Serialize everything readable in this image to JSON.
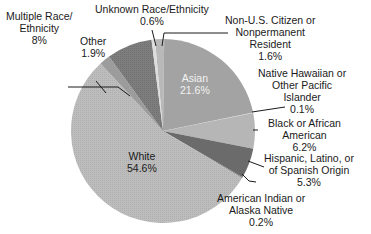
{
  "chart_data": {
    "type": "pie",
    "title": "",
    "center": [
      163,
      131
    ],
    "radius": 92,
    "start_angle_deg": -95,
    "slices": [
      {
        "name": "Non-U.S. Citizen or Nonpermanent Resident",
        "value": 1.6,
        "label": "1.6%",
        "color": "#b9b9b9"
      },
      {
        "name": "Asian",
        "value": 21.6,
        "label": "21.6%",
        "color": "#a3a3a3"
      },
      {
        "name": "Native Hawaiian or Other Pacific Islander",
        "value": 0.1,
        "label": "0.1%",
        "color": "#c8c8c8"
      },
      {
        "name": "Black or African American",
        "value": 6.2,
        "label": "6.2%",
        "color": "#b6b6b6"
      },
      {
        "name": "Hispanic, Latino, or of Spanish Origin",
        "value": 5.3,
        "label": "5.3%",
        "color": "#6b6b6b"
      },
      {
        "name": "American Indian or Alaska Native",
        "value": 0.2,
        "label": "0.2%",
        "color": "#8a8a8a"
      },
      {
        "name": "White",
        "value": 54.6,
        "label": "54.6%",
        "color": "#bdbdbd"
      },
      {
        "name": "Other",
        "value": 1.9,
        "label": "1.9%",
        "color": "#9c9c9c"
      },
      {
        "name": "Multiple Race/Ethnicity",
        "value": 8,
        "label": "8%",
        "color": "#7e7e7e"
      },
      {
        "name": "Unknown Race/Ethnicity",
        "value": 0.6,
        "label": "0.6%",
        "color": "#dcdcdc"
      }
    ],
    "legend": "none (callout labels)"
  },
  "labels": {
    "multiple": {
      "l1": "Multiple Race/",
      "l2": "Ethnicity",
      "l3": "8%"
    },
    "unknown": {
      "l1": "Unknown Race/Ethnicity",
      "l2": "0.6%"
    },
    "nonus": {
      "l1": "Non-U.S. Citizen or",
      "l2": "Nonpermanent",
      "l3": "Resident",
      "l4": "1.6%"
    },
    "other": {
      "l1": "Other",
      "l2": "1.9%"
    },
    "asian": {
      "l1": "Asian",
      "l2": "21.6%"
    },
    "hawaiian": {
      "l1": "Native Hawaiian or",
      "l2": "Other Pacific",
      "l3": "Islander",
      "l4": "0.1%"
    },
    "black": {
      "l1": "Black or African",
      "l2": "American",
      "l3": "6.2%"
    },
    "hispanic": {
      "l1": "Hispanic, Latino, or",
      "l2": "of Spanish Origin",
      "l3": "5.3%"
    },
    "white": {
      "l1": "White",
      "l2": "54.6%"
    },
    "amind": {
      "l1": "American Indian or",
      "l2": "Alaska Native",
      "l3": "0.2%"
    }
  }
}
